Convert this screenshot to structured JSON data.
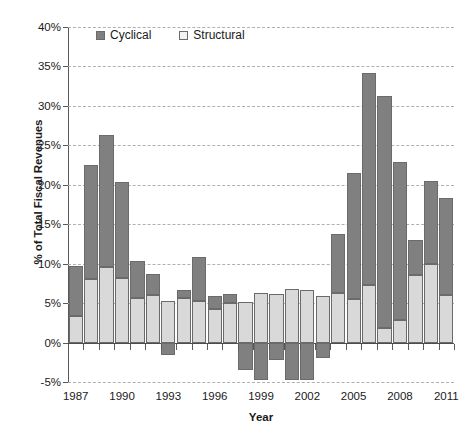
{
  "chart_data": {
    "type": "bar",
    "stacked": true,
    "title": "",
    "xlabel": "Year",
    "ylabel": "% of Total Fiscal Revenues",
    "ylim": [
      -5,
      40
    ],
    "ytick_step": 5,
    "ytick_labels": [
      "40%",
      "35%",
      "30%",
      "25%",
      "20%",
      "15%",
      "10%",
      "5%",
      "0%",
      "-5%"
    ],
    "ytick_values": [
      40,
      35,
      30,
      25,
      20,
      15,
      10,
      5,
      0,
      -5
    ],
    "grid": true,
    "legend_position": "top-center-inside",
    "categories": [
      "1987",
      "1988",
      "1989",
      "1990",
      "1991",
      "1992",
      "1993",
      "1994",
      "1995",
      "1996",
      "1997",
      "1998",
      "1999",
      "2000",
      "2001",
      "2002",
      "2003",
      "2004",
      "2005",
      "2006",
      "2007",
      "2008",
      "2009",
      "2010",
      "2011"
    ],
    "xtick_labels": [
      "1987",
      "1990",
      "1993",
      "1996",
      "1999",
      "2002",
      "2005",
      "2008",
      "2011"
    ],
    "xtick_categories": [
      "1987",
      "1990",
      "1993",
      "1996",
      "1999",
      "2002",
      "2005",
      "2008",
      "2011"
    ],
    "series": [
      {
        "name": "Structural",
        "color": "#d9d9d9",
        "values": [
          3.4,
          8.1,
          9.6,
          8.2,
          5.7,
          6.0,
          5.3,
          5.6,
          5.3,
          4.3,
          5.0,
          5.1,
          6.3,
          6.2,
          6.8,
          6.7,
          5.9,
          6.3,
          5.5,
          7.3,
          1.9,
          2.8,
          8.6,
          9.9,
          6.0
        ]
      },
      {
        "name": "Cyclical",
        "color": "#808080",
        "values": [
          6.3,
          14.4,
          16.7,
          12.2,
          4.7,
          2.7,
          -1.6,
          1.0,
          5.6,
          1.6,
          1.2,
          -3.5,
          -4.8,
          -2.2,
          -4.7,
          -4.8,
          -1.9,
          7.4,
          16.0,
          26.9,
          29.4,
          20.1,
          4.4,
          10.6,
          12.3
        ]
      }
    ],
    "totals": [
      9.7,
      22.5,
      26.3,
      20.4,
      10.4,
      8.7,
      5.3,
      6.6,
      10.9,
      5.9,
      6.2,
      5.1,
      6.3,
      6.2,
      6.8,
      6.7,
      5.9,
      13.7,
      21.5,
      34.2,
      31.3,
      22.9,
      13.0,
      20.5,
      18.3
    ]
  },
  "legend": {
    "entries": [
      {
        "label": "Cyclical",
        "swatch": "dark-gray-swatch"
      },
      {
        "label": "Structural",
        "swatch": "light-gray-swatch"
      }
    ]
  },
  "axes": {
    "x_title": "Year",
    "y_title": "% of Total Fiscal Revenues"
  },
  "colors": {
    "cyclical": "#808080",
    "structural": "#d9d9d9",
    "grid": "#b0b0b0",
    "axis": "#595959",
    "bar_outline": "#6b6b6b",
    "background": "#ffffff"
  }
}
